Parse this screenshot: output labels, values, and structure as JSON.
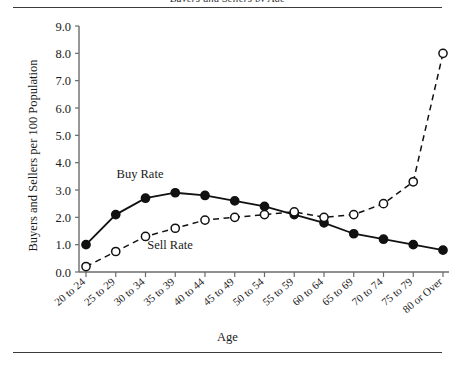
{
  "figure": {
    "clipped_header": "Buyers and Sellers by Age",
    "axis_title_y": "Buyers and Sellers per 100 Population",
    "axis_title_x": "Age",
    "buy_label": "Buy Rate",
    "sell_label": "Sell Rate",
    "colors": {
      "ink": "#1a1a1a",
      "rule": "#3a3a3a",
      "background": "#ffffff"
    }
  },
  "chart_data": {
    "type": "line",
    "title": "",
    "xlabel": "Age",
    "ylabel": "Buyers and Sellers per 100 Population",
    "ylim": [
      0.0,
      9.0
    ],
    "ytick_labels": [
      "0.0",
      "1.0",
      "2.0",
      "3.0",
      "4.0",
      "5.0",
      "6.0",
      "7.0",
      "8.0",
      "9.0"
    ],
    "yticks": [
      0.0,
      1.0,
      2.0,
      3.0,
      4.0,
      5.0,
      6.0,
      7.0,
      8.0,
      9.0
    ],
    "grid": false,
    "legend_position": "inline-annotations",
    "categories": [
      "20 to 24",
      "25 to 29",
      "30 to 34",
      "35 to 39",
      "40 to 44",
      "45 to 49",
      "50 to 54",
      "55 to 59",
      "60 to 64",
      "65 to 69",
      "70 to 74",
      "75 to 79",
      "80 or Over"
    ],
    "series": [
      {
        "name": "Buy Rate",
        "marker": "filled-circle",
        "line_style": "solid",
        "values": [
          1.0,
          2.1,
          2.7,
          2.9,
          2.8,
          2.6,
          2.4,
          2.1,
          1.8,
          1.4,
          1.2,
          1.0,
          0.8
        ]
      },
      {
        "name": "Sell Rate",
        "marker": "open-circle",
        "line_style": "dashed",
        "values": [
          0.2,
          0.75,
          1.3,
          1.6,
          1.9,
          2.0,
          2.1,
          2.2,
          2.0,
          2.1,
          2.5,
          3.3,
          8.0
        ]
      }
    ]
  }
}
